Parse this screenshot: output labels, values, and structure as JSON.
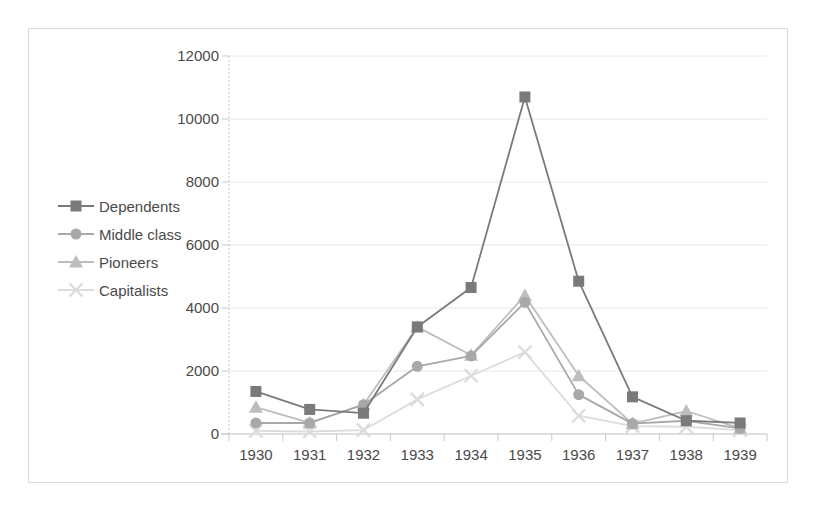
{
  "chart_data": {
    "type": "line",
    "title": "",
    "xlabel": "",
    "ylabel": "",
    "categories": [
      "1930",
      "1931",
      "1932",
      "1933",
      "1934",
      "1935",
      "1936",
      "1937",
      "1938",
      "1939"
    ],
    "yticks": [
      0,
      2000,
      4000,
      6000,
      8000,
      10000,
      12000
    ],
    "ylim": [
      0,
      12000
    ],
    "grid": true,
    "legend_position": "left-inside",
    "series": [
      {
        "name": "Dependents",
        "marker": "square",
        "color": "#7a7a7a",
        "values": [
          1350,
          780,
          660,
          3400,
          4650,
          10700,
          4850,
          1180,
          420,
          350
        ]
      },
      {
        "name": "Middle class",
        "marker": "circle",
        "color": "#a8a8a8",
        "values": [
          350,
          350,
          930,
          2150,
          2480,
          4180,
          1250,
          330,
          420,
          180
        ]
      },
      {
        "name": "Pioneers",
        "marker": "triangle",
        "color": "#bdbdbd",
        "values": [
          850,
          350,
          930,
          3400,
          2500,
          4400,
          1850,
          330,
          730,
          180
        ]
      },
      {
        "name": "Capitalists",
        "marker": "cross",
        "color": "#dcdcdc",
        "values": [
          100,
          80,
          120,
          1100,
          1850,
          2600,
          580,
          250,
          230,
          120
        ]
      }
    ]
  },
  "colors": {
    "frame_border": "#d9d9d9",
    "gridline": "#e8e8e8",
    "axis": "#c9c9c9",
    "tick_text": "#4a4a4a",
    "background": "#ffffff"
  }
}
